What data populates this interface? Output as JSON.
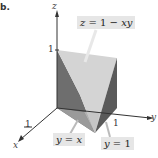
{
  "part_label": "b.",
  "axes": {
    "x": "x",
    "y": "y",
    "z": "z"
  },
  "ticks": {
    "z_one": "1",
    "y_one": "1",
    "x_one": "1"
  },
  "surface_label": {
    "lhs": "z",
    "eq": " = 1 − ",
    "rhs": "xy"
  },
  "plane_labels": [
    {
      "lhs": "y",
      "eq": " = ",
      "rhs": "x"
    },
    {
      "lhs": "y",
      "eq": " = ",
      "rhs": "1"
    }
  ],
  "colors": {
    "surface_top": "#d9d9d9",
    "face_left": "#6e6e6e",
    "face_right": "#5a5a5a",
    "face_front": "#9a9a9a",
    "face_center": "#c8c8c8",
    "label_bg": "#e6e6e6",
    "axis": "#333333"
  }
}
